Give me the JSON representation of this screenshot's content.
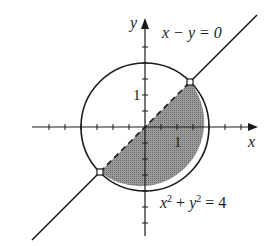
{
  "figure": {
    "type": "diagram",
    "labels": {
      "x_axis": "x",
      "y_axis": "y",
      "line_eq": "x − y = 0",
      "circle_eq_lhs_x": "x",
      "circle_eq_sup1": "2",
      "circle_eq_plus": " + ",
      "circle_eq_lhs_y": "y",
      "circle_eq_sup2": "2",
      "circle_eq_rhs": " = 4",
      "tick_x_1": "1",
      "tick_y_1": "1"
    },
    "circle": {
      "equation": "x^2 + y^2 = 4",
      "center": [
        0,
        0
      ],
      "radius": 2
    },
    "line": {
      "equation": "x - y = 0",
      "style_inside_circle": "dashed"
    },
    "intersection_points": [
      [
        1.414,
        1.414
      ],
      [
        -1.414,
        -1.414
      ]
    ],
    "shaded_region": "half-disk below the line y = x",
    "tick_spacing": 0.5,
    "colors": {
      "stroke": "#1a1a1a",
      "shade": "#8a8a8a",
      "background": "#ffffff"
    }
  }
}
